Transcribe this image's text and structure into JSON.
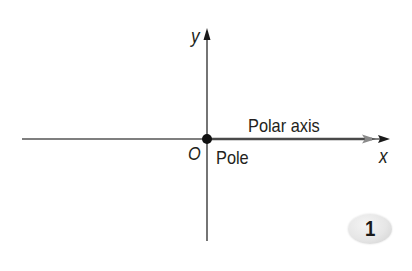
{
  "diagram": {
    "type": "polar-coordinate-axes",
    "labels": {
      "y_axis": "y",
      "x_axis": "x",
      "origin": "O",
      "pole": "Pole",
      "polar_axis": "Polar axis"
    },
    "badge": "1",
    "colors": {
      "axis": "#3a3a3a",
      "polar_axis": "#4a4a4a",
      "polar_arrow": "#8a8a8a",
      "pole_dot": "#111111",
      "text": "#231f20",
      "badge_fill": "#e6e6e6"
    }
  }
}
